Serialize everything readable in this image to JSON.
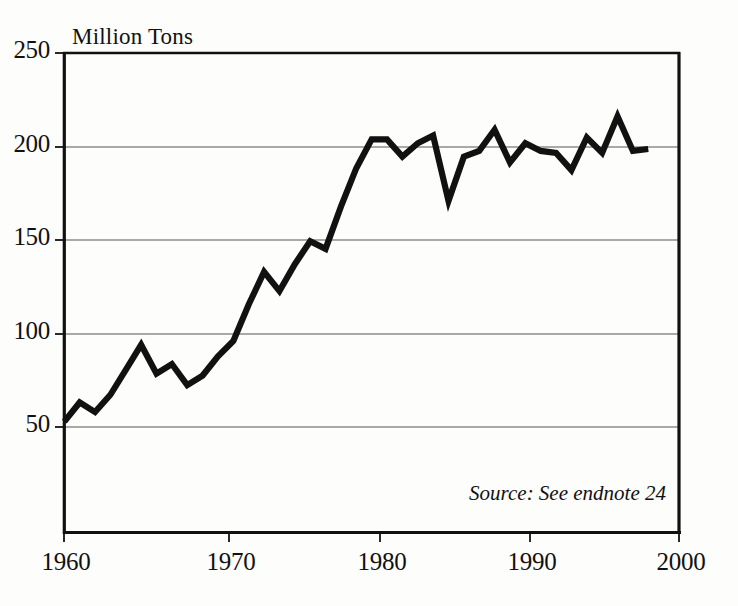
{
  "chart_data": {
    "type": "line",
    "title": "",
    "ylabel": "Million Tons",
    "xlabel": "",
    "xlim": [
      1960,
      2000
    ],
    "ylim": [
      0,
      250
    ],
    "grid": true,
    "legend": "none",
    "annotations": [
      "Source: See endnote 24"
    ],
    "yticks": [
      50,
      100,
      150,
      200,
      250
    ],
    "ytick_labels": [
      "50",
      "100",
      "150",
      "200",
      "250"
    ],
    "xticks": [
      1960,
      1970,
      1980,
      1990,
      2000
    ],
    "xtick_labels": [
      "1960",
      "1970",
      "1980",
      "1990",
      "2000"
    ],
    "line_color": "#111111",
    "grid_color": "#888888",
    "x": [
      1960,
      1961,
      1962,
      1963,
      1964,
      1965,
      1966,
      1967,
      1968,
      1969,
      1970,
      1971,
      1972,
      1973,
      1974,
      1975,
      1976,
      1977,
      1978,
      1979,
      1980,
      1981,
      1982,
      1983,
      1984,
      1985,
      1986,
      1987,
      1988,
      1989,
      1990,
      1991,
      1992,
      1993,
      1994,
      1995,
      1996,
      1997,
      1998
    ],
    "values": [
      58,
      68,
      63,
      72,
      85,
      98,
      83,
      88,
      77,
      82,
      92,
      100,
      119,
      136,
      126,
      140,
      152,
      148,
      170,
      190,
      205,
      205,
      196,
      203,
      207,
      173,
      196,
      199,
      210,
      193,
      203,
      199,
      198,
      189,
      206,
      198,
      217,
      199,
      200
    ],
    "series": [
      {
        "name": "Million Tons",
        "values": [
          58,
          68,
          63,
          72,
          85,
          98,
          83,
          88,
          77,
          82,
          92,
          100,
          119,
          136,
          126,
          140,
          152,
          148,
          170,
          190,
          205,
          205,
          196,
          203,
          207,
          173,
          196,
          199,
          210,
          193,
          203,
          199,
          198,
          189,
          206,
          198,
          217,
          199,
          200
        ]
      }
    ]
  },
  "axis": {
    "unit_label": "Million Tons",
    "ytick_labels": [
      "250",
      "200",
      "150",
      "100",
      "50"
    ],
    "xtick_labels": [
      "1960",
      "1970",
      "1980",
      "1990",
      "2000"
    ]
  },
  "footer": {
    "source_text": "Source: See endnote 24"
  }
}
